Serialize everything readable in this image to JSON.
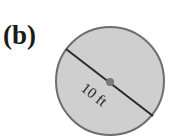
{
  "figure": {
    "label": "(b)",
    "shape": "circle",
    "dimension_label": "10 ft",
    "dimension_type": "diameter",
    "colors": {
      "fill": "#cfcfcf",
      "stroke": "#6e6e6e",
      "line": "#2a2a2a",
      "center_dot": "#7a7a7a"
    }
  }
}
